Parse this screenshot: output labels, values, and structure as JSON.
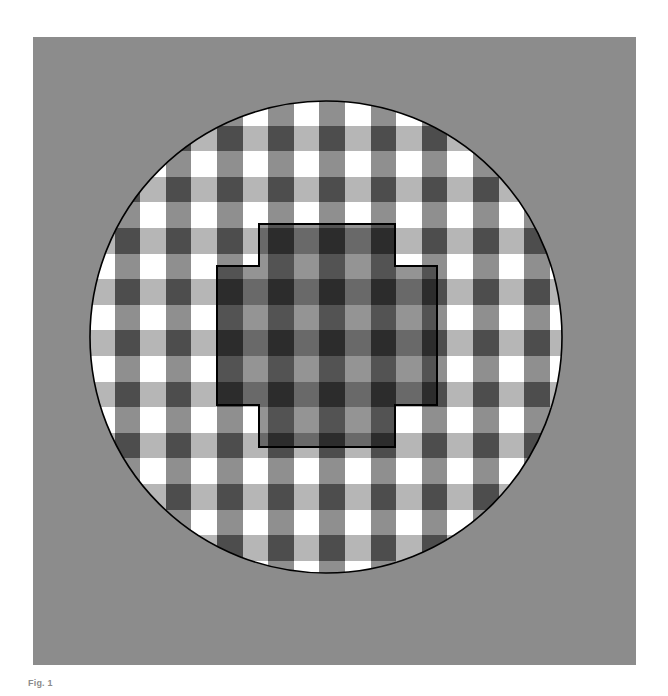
{
  "page": {
    "background_color": "#ffffff",
    "width": 668,
    "height": 696
  },
  "figure": {
    "name": "checkerboard-transparency-illusion",
    "panel": {
      "x": 33,
      "y": 37,
      "width": 603,
      "height": 628,
      "background_color": "#8c8c8c"
    },
    "circle": {
      "center_x": 293,
      "center_y": 300,
      "radius": 236,
      "stroke_color": "#000000",
      "stroke_width": 1.6
    },
    "checkerboard": {
      "cell_size": 25.6,
      "origin_x": 56,
      "origin_y": 63,
      "palette": {
        "white": "#ffffff",
        "light_gray": "#b6b6b6",
        "mid_gray": "#8f8f8f",
        "dark_gray": "#4d4d4d"
      },
      "column_tints": [
        "white",
        "mid_gray",
        "light_gray",
        "dark_gray"
      ],
      "description": "Four-tone checkerboard: alternating white / dark-gray squares interleaved with light-gray / mid-gray squares."
    },
    "overlay": {
      "name": "dark-transparent-cross",
      "shape": "plus-cross",
      "fill_color": "#000000",
      "fill_opacity": 0.42,
      "stroke_color": "#000000",
      "stroke_width": 2,
      "outer_left": 184,
      "outer_top": 187,
      "outer_right": 404,
      "outer_bottom": 410,
      "arm_inset": 42,
      "description": "Cross / plus-shaped dark translucent filter outlined in black, covering the central squares so they appear darker."
    }
  },
  "caption": {
    "number": "Fig. 1",
    "text": "",
    "color": "#2b2b2b",
    "clipped": true
  }
}
